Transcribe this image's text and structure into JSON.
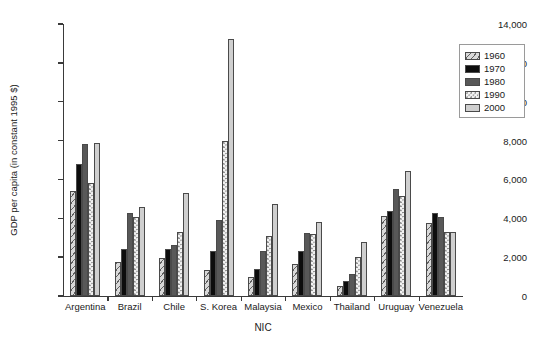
{
  "chart_data": {
    "type": "bar",
    "title": "",
    "xlabel": "NIC",
    "ylabel": "GDP per capita (in constant 1995 $)",
    "categories": [
      "Argentina",
      "Brazil",
      "Chile",
      "S. Korea",
      "Malaysia",
      "Mexico",
      "Thailand",
      "Uruguay",
      "Venezuela"
    ],
    "ylim": [
      0,
      14000
    ],
    "yticks": [
      0,
      2000,
      4000,
      6000,
      8000,
      10000,
      12000,
      14000
    ],
    "ytick_labels": [
      "0",
      "2,000",
      "4,000",
      "6,000",
      "8,000",
      "10,000",
      "12,000",
      "14,000"
    ],
    "grid": false,
    "legend_position": "top-right",
    "series": [
      {
        "name": "1960",
        "pattern": "diagonal-hatch",
        "values": [
          5400,
          1750,
          1950,
          1350,
          1000,
          1650,
          500,
          4100,
          3750
        ]
      },
      {
        "name": "1970",
        "pattern": "solid-black",
        "values": [
          6800,
          2400,
          2400,
          2300,
          1400,
          2300,
          750,
          4400,
          4250
        ]
      },
      {
        "name": "1980",
        "pattern": "solid-dark-gray",
        "values": [
          7800,
          4250,
          2650,
          3900,
          2300,
          3250,
          1150,
          5500,
          4050
        ]
      },
      {
        "name": "1990",
        "pattern": "dotted-stipple",
        "values": [
          5800,
          4050,
          3300,
          8000,
          3100,
          3180,
          2000,
          5150,
          3300
        ]
      },
      {
        "name": "2000",
        "pattern": "solid-light-gray",
        "values": [
          7900,
          4600,
          5300,
          13250,
          4750,
          3800,
          2800,
          6450,
          3300
        ]
      }
    ]
  },
  "legend": {
    "items": [
      {
        "label": "1960"
      },
      {
        "label": "1970"
      },
      {
        "label": "1980"
      },
      {
        "label": "1990"
      },
      {
        "label": "2000"
      }
    ]
  }
}
